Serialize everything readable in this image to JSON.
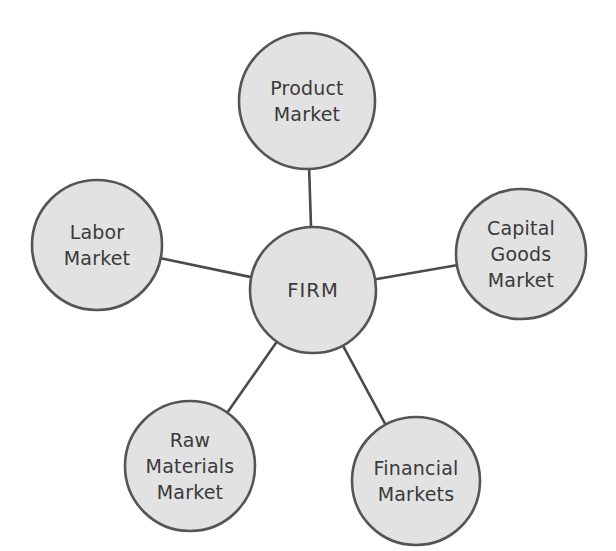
{
  "diagram": {
    "type": "hub-and-spoke",
    "background_color": "#ffffff",
    "node_fill_color": "#e2e2e2",
    "node_border_color": "#555555",
    "edge_color": "#4a4a4a",
    "text_color": "#3a3a3a",
    "center": {
      "id": "firm",
      "label": "FIRM",
      "lines": [
        "FIRM"
      ],
      "cx": 313,
      "cy": 290,
      "r": 63
    },
    "nodes": [
      {
        "id": "product-market",
        "label": "Product Market",
        "lines": [
          "Product",
          "Market"
        ],
        "cx": 307,
        "cy": 101,
        "r": 68
      },
      {
        "id": "labor-market",
        "label": "Labor Market",
        "lines": [
          "Labor",
          "Market"
        ],
        "cx": 97,
        "cy": 245,
        "r": 65
      },
      {
        "id": "capital-goods-market",
        "label": "Capital Goods Market",
        "lines": [
          "Capital",
          "Goods",
          "Market"
        ],
        "cx": 521,
        "cy": 254,
        "r": 65
      },
      {
        "id": "raw-materials-market",
        "label": "Raw Materials Market",
        "lines": [
          "Raw",
          "Materials",
          "Market"
        ],
        "cx": 190,
        "cy": 466,
        "r": 65
      },
      {
        "id": "financial-markets",
        "label": "Financial Markets",
        "lines": [
          "Financial",
          "Markets"
        ],
        "cx": 416,
        "cy": 481,
        "r": 64
      }
    ],
    "edges": [
      {
        "id": "edge-firm-product-market",
        "from": "firm",
        "to": "product-market"
      },
      {
        "id": "edge-firm-labor-market",
        "from": "firm",
        "to": "labor-market"
      },
      {
        "id": "edge-firm-capital-goods-market",
        "from": "firm",
        "to": "capital-goods-market"
      },
      {
        "id": "edge-firm-raw-materials-market",
        "from": "firm",
        "to": "raw-materials-market"
      },
      {
        "id": "edge-firm-financial-markets",
        "from": "firm",
        "to": "financial-markets"
      }
    ]
  }
}
